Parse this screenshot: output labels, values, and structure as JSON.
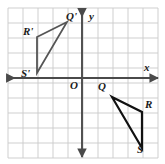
{
  "figure": {
    "background_color": "#ffffff",
    "grid": {
      "color": "#c9c9c9",
      "cell_size": 15,
      "left": 8,
      "top": 8,
      "right": 158,
      "bottom": 158,
      "columns": 10,
      "rows": 10
    },
    "axes": {
      "color": "#4a4a4a",
      "x_axis_y": 78,
      "y_axis_x": 82,
      "x_label": "x",
      "y_label": "y",
      "origin_label": "O"
    },
    "shapes": [
      {
        "name": "triangle-preimage",
        "stroke": "#111111",
        "stroke_width": 2.2,
        "vertices": [
          {
            "label": "Q",
            "x": 112,
            "y": 97
          },
          {
            "label": "R",
            "x": 142,
            "y": 112
          },
          {
            "label": "S",
            "x": 142,
            "y": 148
          }
        ]
      },
      {
        "name": "triangle-image",
        "stroke": "#555555",
        "stroke_width": 1.8,
        "vertices": [
          {
            "label": "Q'",
            "x": 67,
            "y": 22
          },
          {
            "label": "R'",
            "x": 37,
            "y": 37
          },
          {
            "label": "S'",
            "x": 37,
            "y": 73
          }
        ]
      }
    ],
    "labels": [
      {
        "name": "vertex-label-q-prime",
        "text": "Q'",
        "x": 66,
        "y": 11
      },
      {
        "name": "vertex-label-r-prime",
        "text": "R'",
        "x": 23,
        "y": 26
      },
      {
        "name": "vertex-label-s-prime",
        "text": "S'",
        "x": 21,
        "y": 68
      },
      {
        "name": "vertex-label-q",
        "text": "Q",
        "x": 98,
        "y": 81
      },
      {
        "name": "vertex-label-r",
        "text": "R",
        "x": 145,
        "y": 99
      },
      {
        "name": "vertex-label-s",
        "text": "S",
        "x": 137,
        "y": 144
      },
      {
        "name": "origin-label",
        "text": "O",
        "x": 70,
        "y": 80
      },
      {
        "name": "x-axis-label",
        "text": "x",
        "x": 144,
        "y": 62
      },
      {
        "name": "y-axis-label",
        "text": "y",
        "x": 89,
        "y": 11
      }
    ]
  }
}
